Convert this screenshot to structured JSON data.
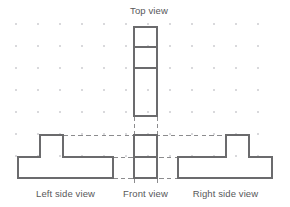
{
  "figure": {
    "kind": "orthographic-projection-drawing",
    "width": 290,
    "height": 207,
    "background_color": "#ffffff",
    "line_color": "#6b6b6d",
    "dashed_line_color": "#8c8c8e",
    "grid_dot_color": "#d9d9dc",
    "label_color": "#58585a"
  },
  "labels": {
    "top_view": "Top view",
    "left_side_view": "Left side view",
    "front_view": "Front view",
    "right_side_view": "Right side view"
  },
  "grid": {
    "origin_x": 16,
    "origin_y": 24,
    "spacing_x": 22,
    "spacing_y": 22,
    "columns": 12,
    "rows": 7,
    "dot_radius": 0.75
  },
  "views": {
    "top": {
      "name": "Top view",
      "shape": "rectangle-with-dividers",
      "x0": 134,
      "y0": 27,
      "x1": 157,
      "y1": 116,
      "divider_y": [
        47,
        68
      ]
    },
    "front": {
      "name": "Front view",
      "shape": "rectangle-with-divider",
      "x0": 134,
      "y0": 135,
      "x1": 157,
      "y1": 178,
      "divider_y": [
        157
      ]
    },
    "left_side": {
      "name": "Left side view",
      "shape": "inverted-tee",
      "base_x0": 18,
      "base_x1": 113,
      "base_top_y": 157,
      "base_bottom_y": 178,
      "riser_x0": 40,
      "riser_x1": 63,
      "riser_top_y": 135
    },
    "right_side": {
      "name": "Right side view",
      "shape": "inverted-tee-mirrored",
      "base_x0": 178,
      "base_x1": 272,
      "base_top_y": 157,
      "base_bottom_y": 178,
      "riser_x0": 226,
      "riser_x1": 249,
      "riser_top_y": 135
    }
  },
  "projection_lines": {
    "horizontal": [
      {
        "y": 135,
        "x0": 63,
        "x1": 226
      },
      {
        "y": 157,
        "x0": 113,
        "x1": 178
      },
      {
        "y": 178,
        "x0": 113,
        "x1": 178
      }
    ],
    "vertical": [
      {
        "x": 134,
        "y0": 116,
        "y1": 135
      },
      {
        "x": 157,
        "y0": 116,
        "y1": 135
      },
      {
        "x": 134,
        "y0": 178,
        "y1": 184
      },
      {
        "x": 157,
        "y0": 178,
        "y1": 184
      }
    ]
  }
}
